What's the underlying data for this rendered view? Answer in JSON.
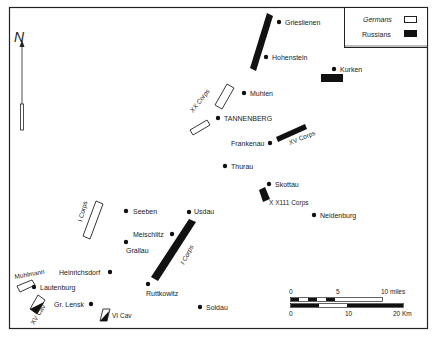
{
  "legend": {
    "germans": "Germans",
    "russians": "Russians"
  },
  "towns": [
    {
      "name": "Grieslienen",
      "x": 279,
      "y": 22,
      "lx": 285,
      "ly": 25
    },
    {
      "name": "Hohenstein",
      "x": 266,
      "y": 57,
      "lx": 272,
      "ly": 60
    },
    {
      "name": "Kurken",
      "x": 334,
      "y": 69,
      "lx": 340,
      "ly": 72
    },
    {
      "name": "Muhlen",
      "x": 244,
      "y": 93,
      "lx": 250,
      "ly": 96
    },
    {
      "name": "TANNENBERG",
      "x": 218,
      "y": 118,
      "lx": 224,
      "ly": 121
    },
    {
      "name": "Frankenau",
      "x": 270,
      "y": 143,
      "lx": 231,
      "ly": 146
    },
    {
      "name": "Thurau",
      "x": 225,
      "y": 166,
      "lx": 231,
      "ly": 169
    },
    {
      "name": "Skottau",
      "x": 269,
      "y": 184,
      "lx": 275,
      "ly": 187
    },
    {
      "name": "Neidenburg",
      "x": 314,
      "y": 215,
      "lx": 320,
      "ly": 218
    },
    {
      "name": "Seeben",
      "x": 126,
      "y": 211,
      "lx": 133,
      "ly": 214
    },
    {
      "name": "Usdau",
      "x": 189,
      "y": 212,
      "lx": 194,
      "ly": 214
    },
    {
      "name": "Meischlitz",
      "x": 172,
      "y": 234,
      "lx": 133,
      "ly": 237
    },
    {
      "name": "Grallau",
      "x": 126,
      "y": 242,
      "lx": 126,
      "ly": 253
    },
    {
      "name": "Heinrichsdorf",
      "x": 110,
      "y": 272,
      "lx": 59,
      "ly": 275
    },
    {
      "name": "Lautenburg",
      "x": 34,
      "y": 287,
      "lx": 40,
      "ly": 290
    },
    {
      "name": "Ruttkowitz",
      "x": 148,
      "y": 284,
      "lx": 146,
      "ly": 296
    },
    {
      "name": "Gr. Lensk",
      "x": 91,
      "y": 304,
      "lx": 54,
      "ly": 307
    },
    {
      "name": "Soldau",
      "x": 200,
      "y": 307,
      "lx": 206,
      "ly": 310
    }
  ],
  "unit_labels": {
    "xx_corps": "XX Corps",
    "xv_corps": "XV Corps",
    "xxiii_corps": "X X111 Corps",
    "i_corps_german": "I Corps",
    "i_corps_russian": "I Corps",
    "muhlmann": "Muhlmann",
    "xv_cav": "XV Cav",
    "vi_cav": "VI Cav"
  },
  "scale": {
    "miles_ticks": [
      "0",
      "5",
      "10 miles"
    ],
    "km_ticks": [
      "0",
      "10",
      "20 Km"
    ]
  },
  "compass": "N"
}
